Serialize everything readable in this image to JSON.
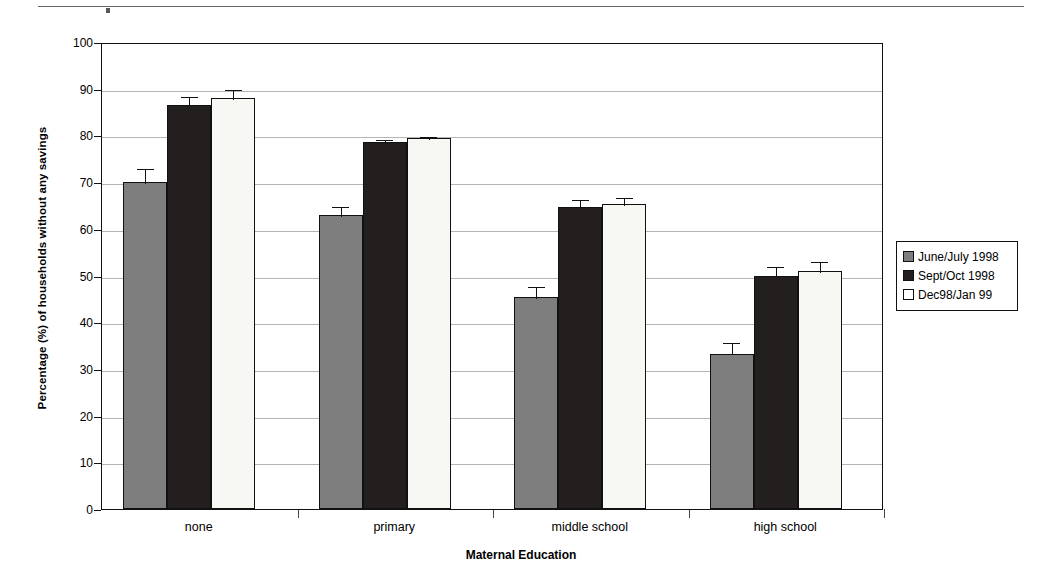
{
  "chart_data": {
    "type": "bar",
    "title": "",
    "xlabel": "Maternal Education",
    "ylabel": "Percentage (%) of households without any savings",
    "categories": [
      "none",
      "primary",
      "middle school",
      "high school"
    ],
    "ylim": [
      0,
      100
    ],
    "yticks": [
      0,
      10,
      20,
      30,
      40,
      50,
      60,
      70,
      80,
      90,
      100
    ],
    "grid": true,
    "legend_position": "right",
    "series": [
      {
        "name": "June/July 1998",
        "color": "#7e7e7e",
        "values": [
          70.0,
          63.0,
          45.3,
          33.3
        ],
        "errors": [
          3.3,
          2.0,
          2.7,
          2.6
        ]
      },
      {
        "name": "Sept/Oct 1998",
        "color": "#231f1f",
        "values": [
          86.5,
          78.5,
          64.7,
          50.0
        ],
        "errors": [
          2.2,
          1.0,
          1.8,
          2.3
        ]
      },
      {
        "name": "Dec98/Jan 99",
        "color": "#ffffff",
        "values": [
          88.0,
          79.5,
          65.3,
          51.0
        ],
        "errors": [
          2.2,
          0.6,
          1.8,
          2.4
        ]
      }
    ]
  },
  "legend": {
    "items": [
      {
        "label": "June/July 1998"
      },
      {
        "label": "Sept/Oct 1998"
      },
      {
        "label": "Dec98/Jan 99"
      }
    ]
  }
}
